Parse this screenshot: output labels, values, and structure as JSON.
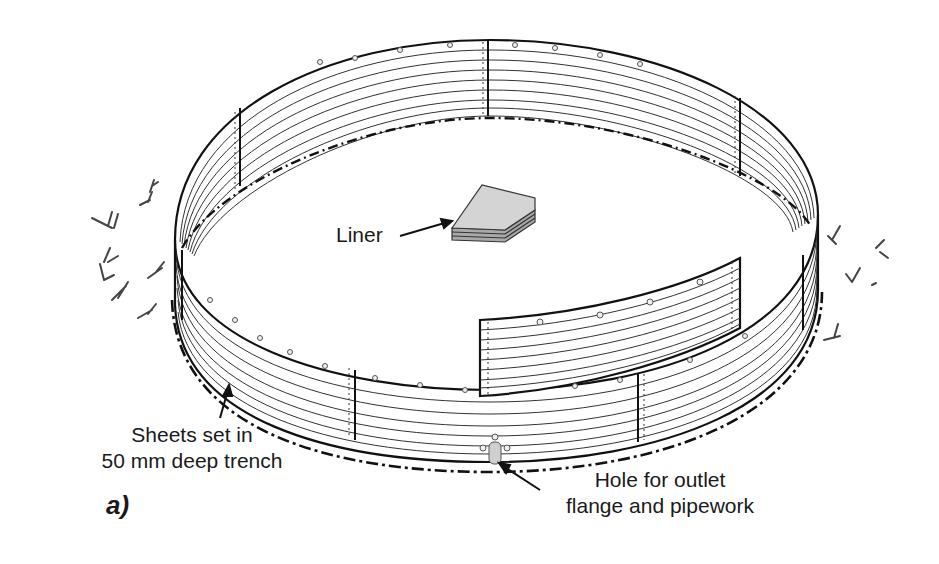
{
  "figure": {
    "label": "a)"
  },
  "annotations": {
    "liner": "Liner",
    "trench_line1": "Sheets set in",
    "trench_line2": "50 mm deep trench",
    "outlet_line1": "Hole for outlet",
    "outlet_line2": "flange and pipework"
  },
  "colors": {
    "ink": "#1a1a1a",
    "sheet_line": "#333333",
    "liner_fill": "#d4d4d4",
    "liner_side": "#a9a9a9",
    "background": "#ffffff"
  }
}
